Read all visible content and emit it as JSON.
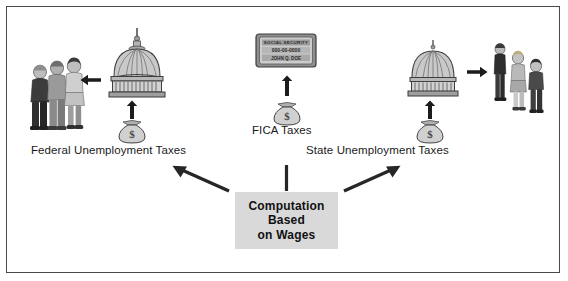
{
  "diagram": {
    "background_color": "#ffffff",
    "border_color": "#4a4a4a",
    "box_fill_color": "#d9d9d9",
    "arrow_color": "#262626"
  },
  "center": {
    "lines": [
      "Computation",
      "Based",
      "on Wages"
    ],
    "line1": "Computation",
    "line2": "Based",
    "line3": "on Wages"
  },
  "branches": {
    "left": {
      "label": "Federal Unemployment Taxes",
      "money_icon": "money-bag-icon",
      "destination_icon": "capitol-dome-icon",
      "recipients_icon": "people-group-icon"
    },
    "center": {
      "label": "FICA Taxes",
      "money_icon": "money-bag-icon",
      "destination_icon": "social-security-card-icon"
    },
    "right": {
      "label": "State Unemployment Taxes",
      "money_icon": "money-bag-icon",
      "destination_icon": "state-capitol-dome-icon",
      "recipients_icon": "people-group-icon"
    }
  },
  "card": {
    "heading": "SOCIAL SECURITY",
    "number": "000-00-0000",
    "name": "JOHN Q. DOE"
  },
  "arrows": {
    "left_diagonal": "arrow-up-left-icon",
    "center_vertical": "arrow-up-icon",
    "right_diagonal": "arrow-up-right-icon",
    "left_branch_up": "arrow-up-icon",
    "center_branch_up": "arrow-up-icon",
    "right_branch_up": "arrow-up-icon",
    "left_to_people": "arrow-left-icon",
    "right_to_people": "arrow-right-icon"
  }
}
